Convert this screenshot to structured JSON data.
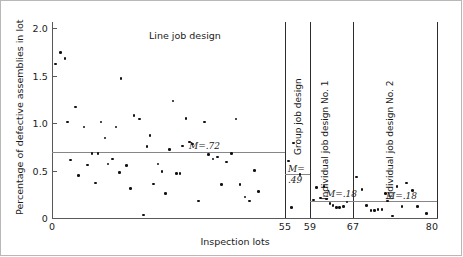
{
  "chart_data": {
    "type": "scatter",
    "title": "",
    "xlabel": "Inspection lots",
    "ylabel": "Percentage of defective assemblies in lot",
    "xlim": [
      0,
      80
    ],
    "ylim": [
      0,
      2.15
    ],
    "grid": false,
    "legend": "none",
    "y_ticks": [
      "0",
      "0.5",
      "1.0",
      "1.5",
      "2.0"
    ],
    "y_tick_values": [
      0,
      0.5,
      1.0,
      1.5,
      2.0
    ],
    "x_ticks": [
      "0",
      "55",
      "59",
      "67",
      "80"
    ],
    "x_tick_values": [
      0,
      55,
      59,
      67,
      80
    ],
    "panels": [
      {
        "name": "Line job design",
        "label_orientation": "horizontal",
        "x_range": [
          0,
          55
        ],
        "mean": 0.72,
        "mean_label": "M=.72",
        "points": [
          {
            "x": 0.8,
            "y": 1.62
          },
          {
            "x": 2.0,
            "y": 1.74
          },
          {
            "x": 3.1,
            "y": 1.68
          },
          {
            "x": 3.6,
            "y": 1.01
          },
          {
            "x": 4.4,
            "y": 0.61
          },
          {
            "x": 5.6,
            "y": 1.17
          },
          {
            "x": 6.2,
            "y": 0.45
          },
          {
            "x": 7.6,
            "y": 0.96
          },
          {
            "x": 8.4,
            "y": 0.56
          },
          {
            "x": 9.4,
            "y": 0.68
          },
          {
            "x": 10.2,
            "y": 0.37
          },
          {
            "x": 10.9,
            "y": 0.68
          },
          {
            "x": 11.6,
            "y": 1.01
          },
          {
            "x": 12.5,
            "y": 0.84
          },
          {
            "x": 13.2,
            "y": 0.57
          },
          {
            "x": 14.3,
            "y": 0.62
          },
          {
            "x": 15.1,
            "y": 0.96
          },
          {
            "x": 15.9,
            "y": 0.48
          },
          {
            "x": 16.3,
            "y": 1.47
          },
          {
            "x": 17.6,
            "y": 0.55
          },
          {
            "x": 18.6,
            "y": 0.31
          },
          {
            "x": 19.4,
            "y": 1.08
          },
          {
            "x": 20.6,
            "y": 1.04
          },
          {
            "x": 21.6,
            "y": 0.03
          },
          {
            "x": 22.4,
            "y": 0.75
          },
          {
            "x": 23.1,
            "y": 0.87
          },
          {
            "x": 24.0,
            "y": 0.36
          },
          {
            "x": 25.0,
            "y": 0.57
          },
          {
            "x": 26.0,
            "y": 0.49
          },
          {
            "x": 26.8,
            "y": 0.26
          },
          {
            "x": 27.8,
            "y": 0.72
          },
          {
            "x": 28.6,
            "y": 1.23
          },
          {
            "x": 29.4,
            "y": 0.47
          },
          {
            "x": 30.2,
            "y": 0.47
          },
          {
            "x": 30.8,
            "y": 0.76
          },
          {
            "x": 31.6,
            "y": 1.05
          },
          {
            "x": 32.4,
            "y": 0.8
          },
          {
            "x": 33.2,
            "y": 0.78
          },
          {
            "x": 34.6,
            "y": 0.18
          },
          {
            "x": 36.0,
            "y": 1.01
          },
          {
            "x": 37.0,
            "y": 0.67
          },
          {
            "x": 38.0,
            "y": 0.62
          },
          {
            "x": 39.0,
            "y": 0.64
          },
          {
            "x": 40.0,
            "y": 0.35
          },
          {
            "x": 41.2,
            "y": 0.59
          },
          {
            "x": 42.4,
            "y": 0.68
          },
          {
            "x": 43.4,
            "y": 1.04
          },
          {
            "x": 44.4,
            "y": 0.35
          },
          {
            "x": 45.6,
            "y": 0.22
          },
          {
            "x": 46.6,
            "y": 0.18
          },
          {
            "x": 47.8,
            "y": 0.5
          },
          {
            "x": 48.8,
            "y": 0.28
          }
        ]
      },
      {
        "name": "Group job design",
        "label_orientation": "vertical",
        "x_range": [
          55,
          59
        ],
        "mean": 0.49,
        "mean_label": "M=.49",
        "points": [
          {
            "x": 55.6,
            "y": 0.6
          },
          {
            "x": 56.4,
            "y": 0.79
          },
          {
            "x": 57.4,
            "y": 0.46
          },
          {
            "x": 56.0,
            "y": 0.11
          }
        ]
      },
      {
        "name": "Individual job design No. 1",
        "label_orientation": "vertical",
        "x_range": [
          59,
          67
        ],
        "mean": 0.18,
        "mean_label": "M=.18",
        "points": [
          {
            "x": 59.6,
            "y": 0.19
          },
          {
            "x": 60.2,
            "y": 0.32
          },
          {
            "x": 60.9,
            "y": 0.21
          },
          {
            "x": 61.6,
            "y": 0.33
          },
          {
            "x": 62.1,
            "y": 0.2
          },
          {
            "x": 62.7,
            "y": 0.15
          },
          {
            "x": 63.3,
            "y": 0.13
          },
          {
            "x": 63.9,
            "y": 0.11
          },
          {
            "x": 64.5,
            "y": 0.11
          },
          {
            "x": 65.2,
            "y": 0.12
          },
          {
            "x": 65.9,
            "y": 0.17
          }
        ]
      },
      {
        "name": "Individual job design No. 2",
        "label_orientation": "vertical",
        "x_range": [
          67,
          80
        ],
        "mean": 0.18,
        "mean_label": "M=.18",
        "points": [
          {
            "x": 67.5,
            "y": 0.43
          },
          {
            "x": 68.4,
            "y": 0.3
          },
          {
            "x": 69.1,
            "y": 0.13
          },
          {
            "x": 69.8,
            "y": 0.08
          },
          {
            "x": 70.3,
            "y": 0.08
          },
          {
            "x": 70.9,
            "y": 0.09
          },
          {
            "x": 71.5,
            "y": 0.09
          },
          {
            "x": 72.3,
            "y": 0.18
          },
          {
            "x": 73.1,
            "y": 0.02
          },
          {
            "x": 73.8,
            "y": 0.33
          },
          {
            "x": 74.6,
            "y": 0.12
          },
          {
            "x": 75.3,
            "y": 0.37
          },
          {
            "x": 76.2,
            "y": 0.29
          },
          {
            "x": 77.0,
            "y": 0.12
          },
          {
            "x": 78.4,
            "y": 0.05
          },
          {
            "x": 72.0,
            "y": 0.26
          }
        ]
      }
    ]
  },
  "mean_labels": {
    "line": "M=.72",
    "group_part1": "M=",
    "group_part2": ".49",
    "individual1": "M=.18",
    "individual2": "M=.18"
  },
  "colors": {
    "point": "#111113",
    "axis": "#59595b",
    "mean_line": "#86868a",
    "divider": "#2d2d2f",
    "background": "#ffffff",
    "text": "#1b1b1b"
  }
}
